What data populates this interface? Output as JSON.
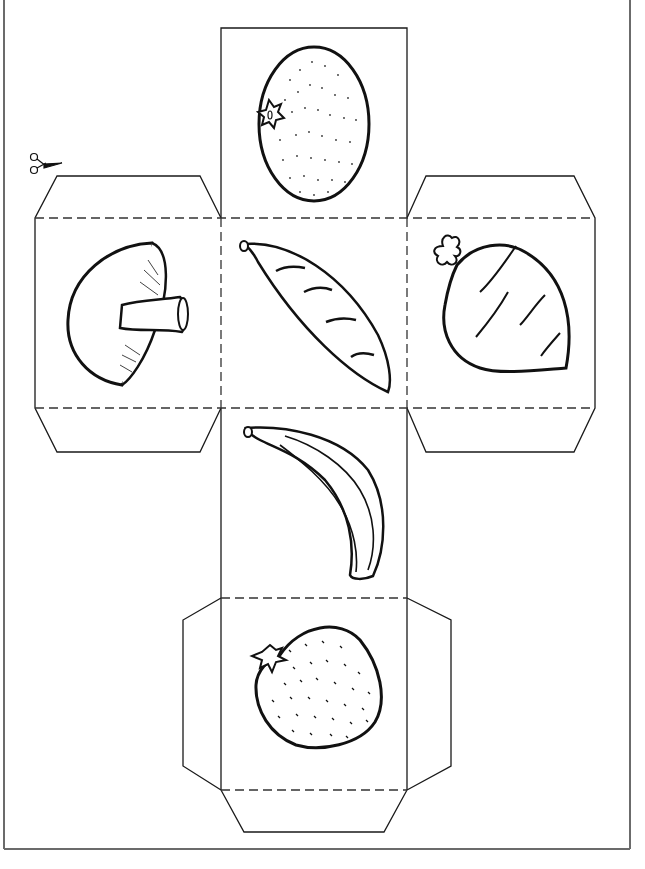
{
  "worksheet": {
    "type": "cube-net-cutout",
    "cut_icon": "scissors-icon",
    "colors": {
      "line": "#1a1a1a",
      "frame": "#6b6b6b",
      "background": "#ffffff"
    },
    "faces": [
      {
        "position": "top",
        "item": "orange",
        "icon": "orange-icon"
      },
      {
        "position": "left",
        "item": "mushroom",
        "icon": "mushroom-icon"
      },
      {
        "position": "center",
        "item": "pea pod",
        "icon": "pea-pod-icon"
      },
      {
        "position": "right",
        "item": "turnip",
        "icon": "turnip-icon"
      },
      {
        "position": "center-lower",
        "item": "banana",
        "icon": "banana-icon"
      },
      {
        "position": "bottom",
        "item": "strawberry",
        "icon": "strawberry-icon"
      }
    ]
  }
}
